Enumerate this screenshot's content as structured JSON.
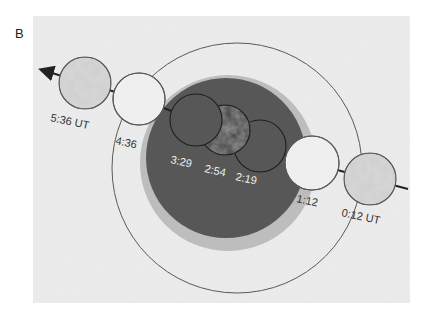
{
  "figure": {
    "panel_label": "B",
    "colors": {
      "background": "#ececec",
      "penumbra": "#bdbdbd",
      "umbra": "#575757",
      "outline": "#5a5a5a",
      "moon_fill": "#d6d6d6",
      "dark_moon_fill": "#4a4a4a",
      "label_dark": "#333333",
      "label_light": "#eeeeee"
    },
    "shadow": {
      "penumbra_outer_circle": {
        "cx": 237,
        "cy": 168,
        "r": 125
      },
      "penumbra_shaded": {
        "cx": 228,
        "cy": 163,
        "r": 88
      },
      "umbra": {
        "cx": 226,
        "cy": 158,
        "r": 80
      }
    },
    "moon_path": {
      "direction": "right-to-left",
      "arrow": "arrow-left"
    },
    "moons": [
      {
        "time": "0:12 UT",
        "cx": 370,
        "cy": 179,
        "r": 26,
        "style": "full"
      },
      {
        "time": "1:12",
        "cx": 312,
        "cy": 163,
        "r": 27,
        "style": "outline"
      },
      {
        "time": "2:19",
        "cx": 260,
        "cy": 146,
        "r": 26,
        "style": "outline"
      },
      {
        "time": "2:54",
        "cx": 225,
        "cy": 130,
        "r": 25,
        "style": "eclipsed"
      },
      {
        "time": "3:29",
        "cx": 196,
        "cy": 120,
        "r": 26,
        "style": "outline"
      },
      {
        "time": "4:36",
        "cx": 139,
        "cy": 99,
        "r": 26,
        "style": "outline"
      },
      {
        "time": "5:36 UT",
        "cx": 85,
        "cy": 83,
        "r": 26,
        "style": "full"
      }
    ],
    "labels": [
      {
        "text": "0:12 UT",
        "x": 341,
        "y": 216,
        "rot": 12,
        "color": "dark"
      },
      {
        "text": "1:12",
        "x": 296,
        "y": 202,
        "rot": 12,
        "color": "dark"
      },
      {
        "text": "2:19",
        "x": 235,
        "y": 180,
        "rot": 12,
        "color": "light"
      },
      {
        "text": "2:54",
        "x": 204,
        "y": 172,
        "rot": 12,
        "color": "light"
      },
      {
        "text": "3:29",
        "x": 170,
        "y": 163,
        "rot": 12,
        "color": "light"
      },
      {
        "text": "4:36",
        "x": 115,
        "y": 144,
        "rot": 12,
        "color": "dark"
      },
      {
        "text": "5:36 UT",
        "x": 50,
        "y": 121,
        "rot": 12,
        "color": "dark"
      }
    ]
  }
}
